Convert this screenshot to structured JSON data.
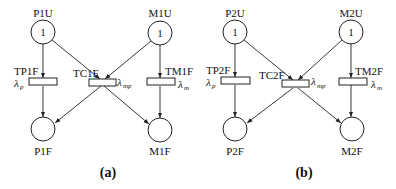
{
  "panels": [
    {
      "caption": "(a)",
      "places": {
        "p_up": {
          "label": "P1U",
          "tokens": "1"
        },
        "m_up": {
          "label": "M1U",
          "tokens": "1"
        },
        "p_fail": {
          "label": "P1F"
        },
        "m_fail": {
          "label": "M1F"
        }
      },
      "transitions": {
        "tp": {
          "label": "TP1F",
          "rate": "λ",
          "rate_sub": "p"
        },
        "tc": {
          "label": "TC1F",
          "rate": "λ",
          "rate_sub": "mp"
        },
        "tm": {
          "label": "TM1F",
          "rate": "λ",
          "rate_sub": "m"
        }
      }
    },
    {
      "caption": "(b)",
      "places": {
        "p_up": {
          "label": "P2U",
          "tokens": "1"
        },
        "m_up": {
          "label": "M2U",
          "tokens": "1"
        },
        "p_fail": {
          "label": "P2F"
        },
        "m_fail": {
          "label": "M2F"
        }
      },
      "transitions": {
        "tp": {
          "label": "TP2F",
          "rate": "λ",
          "rate_sub": "p"
        },
        "tc": {
          "label": "TC2F",
          "rate": "λ",
          "rate_sub": "mp"
        },
        "tm": {
          "label": "TM2F",
          "rate": "λ",
          "rate_sub": "m"
        }
      }
    }
  ]
}
